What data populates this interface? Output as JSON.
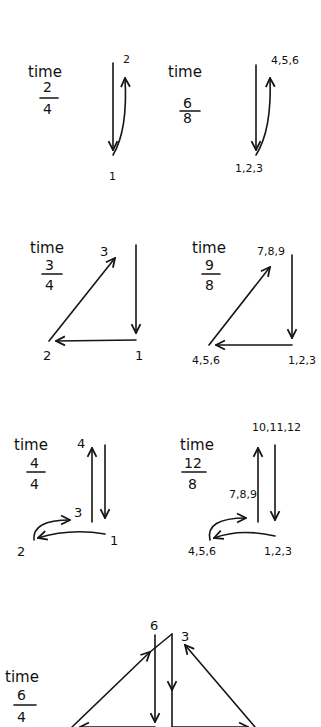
{
  "panels": [
    {
      "id": "p1",
      "time_label": "time",
      "numerator": "2",
      "denominator": "4",
      "points": {
        "start": "1",
        "end": "2"
      }
    },
    {
      "id": "p2",
      "time_label": "time",
      "numerator": "6",
      "denominator": "8",
      "points": {
        "start": "1,2,3",
        "end": "4,5,6"
      }
    },
    {
      "id": "p3",
      "time_label": "time",
      "numerator": "3",
      "denominator": "4",
      "points": {
        "a": "1",
        "b": "2",
        "c": "3"
      }
    },
    {
      "id": "p4",
      "time_label": "time",
      "numerator": "9",
      "denominator": "8",
      "points": {
        "a": "1,2,3",
        "b": "4,5,6",
        "c": "7,8,9"
      }
    },
    {
      "id": "p5",
      "time_label": "time",
      "numerator": "4",
      "denominator": "4",
      "points": {
        "a": "1",
        "b": "2",
        "c": "3",
        "d": "4"
      }
    },
    {
      "id": "p6",
      "time_label": "time",
      "numerator": "12",
      "denominator": "8",
      "points": {
        "a": "1,2,3",
        "b": "4,5,6",
        "c": "7,8,9",
        "d": "10,11,12"
      }
    },
    {
      "id": "p7",
      "time_label": "time",
      "numerator": "6",
      "denominator": "4",
      "points": {
        "left_top": "6",
        "right_top": "3"
      }
    }
  ],
  "colors": {
    "ink": "#151515",
    "paper": "#ffffff"
  }
}
